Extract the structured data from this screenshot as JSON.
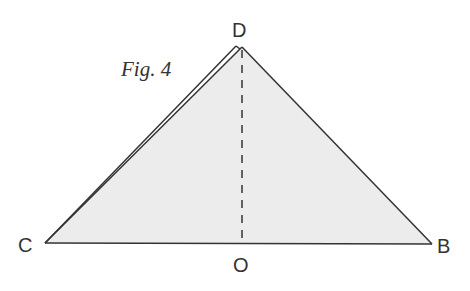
{
  "figure": {
    "caption": "Fig. 4",
    "labels": {
      "D": "D",
      "C": "C",
      "B": "B",
      "O": "O"
    },
    "colors": {
      "fill": "#ececec",
      "stroke": "#333333"
    },
    "points": {
      "C": [
        45,
        243
      ],
      "B": [
        432,
        244
      ],
      "D": [
        242,
        47
      ],
      "O": [
        242,
        243
      ],
      "D_fold": [
        236,
        46
      ]
    }
  }
}
